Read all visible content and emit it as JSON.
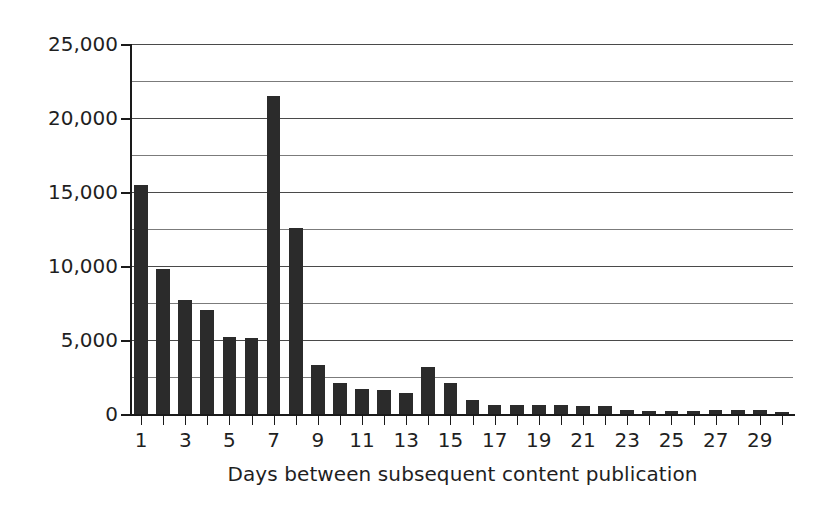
{
  "chart_data": {
    "type": "bar",
    "title": "",
    "xlabel": "Days between subsequent content publication",
    "ylabel": "Frequency",
    "categories": [
      1,
      2,
      3,
      4,
      5,
      6,
      7,
      8,
      9,
      10,
      11,
      12,
      13,
      14,
      15,
      16,
      17,
      18,
      19,
      20,
      21,
      22,
      23,
      24,
      25,
      26,
      27,
      28,
      29,
      30
    ],
    "values": [
      15500,
      9800,
      7700,
      7000,
      5200,
      5150,
      21500,
      12600,
      3300,
      2100,
      1700,
      1650,
      1400,
      3200,
      2100,
      950,
      600,
      600,
      600,
      600,
      550,
      550,
      300,
      180,
      180,
      180,
      300,
      300,
      300,
      150
    ],
    "series": [
      {
        "name": "Frequency",
        "values": [
          15500,
          9800,
          7700,
          7000,
          5200,
          5150,
          21500,
          12600,
          3300,
          2100,
          1700,
          1650,
          1400,
          3200,
          2100,
          950,
          600,
          600,
          600,
          600,
          550,
          550,
          300,
          180,
          180,
          180,
          300,
          300,
          300,
          150
        ]
      }
    ],
    "ylim": [
      0,
      25000
    ],
    "xlim": [
      0.5,
      30.5
    ],
    "y_major_ticks": [
      0,
      5000,
      10000,
      15000,
      20000,
      25000
    ],
    "y_major_tick_labels": [
      "0",
      "5,000",
      "10,000",
      "15,000",
      "20,000",
      "25,000"
    ],
    "y_minor_ticks": [
      2500,
      7500,
      12500,
      17500,
      22500
    ],
    "x_tick_values": [
      1,
      3,
      5,
      7,
      9,
      11,
      13,
      15,
      17,
      19,
      21,
      23,
      25,
      27,
      29
    ],
    "x_tick_labels": [
      "1",
      "3",
      "5",
      "7",
      "9",
      "11",
      "13",
      "15",
      "17",
      "19",
      "21",
      "23",
      "25",
      "27",
      "29"
    ],
    "grid": "horizontal",
    "legend": "none",
    "bar_color": "#2b2b2b",
    "grid_color": "#4a4a4a",
    "axis_color": "#1a1a1a",
    "background": "#ffffff"
  }
}
